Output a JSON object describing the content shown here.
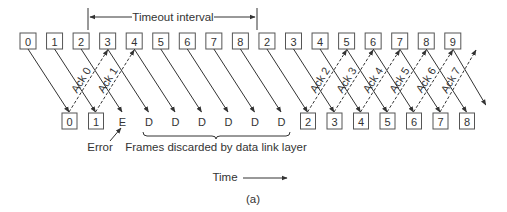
{
  "timeout": {
    "label": "Timeout interval",
    "x_start": 88,
    "x_end": 257,
    "y": 17
  },
  "sent_frames": [
    "0",
    "1",
    "2",
    "3",
    "4",
    "5",
    "6",
    "7",
    "8",
    "2",
    "3",
    "4",
    "5",
    "6",
    "7",
    "8",
    "9"
  ],
  "received": [
    {
      "label": "0",
      "type": "box"
    },
    {
      "label": "1",
      "type": "box"
    },
    {
      "label": "E",
      "type": "text"
    },
    {
      "label": "D",
      "type": "text"
    },
    {
      "label": "D",
      "type": "text"
    },
    {
      "label": "D",
      "type": "text"
    },
    {
      "label": "D",
      "type": "text"
    },
    {
      "label": "D",
      "type": "text"
    },
    {
      "label": "D",
      "type": "text"
    },
    {
      "label": "2",
      "type": "box"
    },
    {
      "label": "3",
      "type": "box"
    },
    {
      "label": "4",
      "type": "box"
    },
    {
      "label": "5",
      "type": "box"
    },
    {
      "label": "6",
      "type": "box"
    },
    {
      "label": "7",
      "type": "box"
    },
    {
      "label": "8",
      "type": "box"
    }
  ],
  "acks": [
    "Ack 0",
    "Ack 1",
    "Ack 2",
    "Ack 3",
    "Ack 4",
    "Ack 5",
    "Ack 6",
    "Ack 7"
  ],
  "annotations": {
    "error": "Error",
    "discarded": "Frames discarded by data link layer",
    "time": "Time",
    "caption": "(a)"
  }
}
